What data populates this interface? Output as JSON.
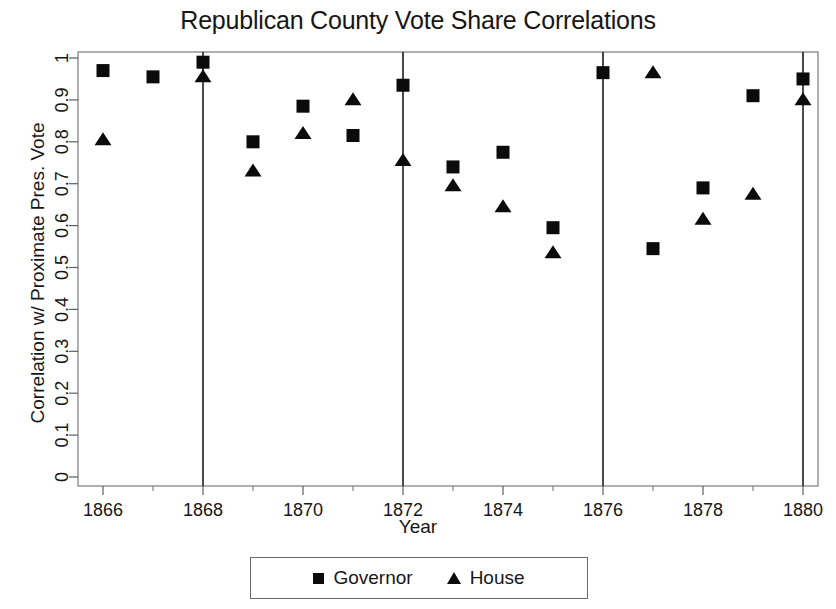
{
  "chart_data": {
    "type": "scatter",
    "title": "Republican County Vote Share Correlations",
    "xlabel": "Year",
    "ylabel": "Correlation w/ Proximate Pres. Vote",
    "xlim": [
      1865.5,
      1880.3
    ],
    "ylim": [
      0,
      1
    ],
    "grid": false,
    "legend_position": "bottom",
    "x_ticks": [
      1866,
      1868,
      1870,
      1872,
      1874,
      1876,
      1878,
      1880
    ],
    "x_tick_labels": [
      "1866",
      "1868",
      "1870",
      "1872",
      "1874",
      "1876",
      "1878",
      "1880"
    ],
    "x_minor_ticks": [
      1867,
      1869,
      1871,
      1873,
      1875,
      1877,
      1879
    ],
    "y_ticks": [
      0,
      0.1,
      0.2,
      0.3,
      0.4,
      0.5,
      0.6,
      0.7,
      0.8,
      0.9,
      1
    ],
    "y_tick_labels": [
      "0",
      "0.1",
      "0.2",
      "0.3",
      "0.4",
      "0.5",
      "0.6",
      "0.7",
      "0.8",
      "0.9",
      "1"
    ],
    "vertical_reference_lines": [
      1868,
      1872,
      1876,
      1880
    ],
    "series": [
      {
        "name": "Governor",
        "marker": "square",
        "color": "#0b0b0b",
        "points": [
          {
            "x": 1866,
            "y": 0.97
          },
          {
            "x": 1867,
            "y": 0.955
          },
          {
            "x": 1868,
            "y": 0.99
          },
          {
            "x": 1869,
            "y": 0.8
          },
          {
            "x": 1870,
            "y": 0.885
          },
          {
            "x": 1871,
            "y": 0.815
          },
          {
            "x": 1872,
            "y": 0.935
          },
          {
            "x": 1873,
            "y": 0.74
          },
          {
            "x": 1874,
            "y": 0.775
          },
          {
            "x": 1875,
            "y": 0.595
          },
          {
            "x": 1876,
            "y": 0.965
          },
          {
            "x": 1877,
            "y": 0.545
          },
          {
            "x": 1878,
            "y": 0.69
          },
          {
            "x": 1879,
            "y": 0.91
          },
          {
            "x": 1880,
            "y": 0.95
          }
        ]
      },
      {
        "name": "House",
        "marker": "triangle",
        "color": "#0b0b0b",
        "points": [
          {
            "x": 1866,
            "y": 0.805
          },
          {
            "x": 1868,
            "y": 0.955
          },
          {
            "x": 1869,
            "y": 0.73
          },
          {
            "x": 1870,
            "y": 0.82
          },
          {
            "x": 1871,
            "y": 0.9
          },
          {
            "x": 1872,
            "y": 0.755
          },
          {
            "x": 1873,
            "y": 0.695
          },
          {
            "x": 1874,
            "y": 0.645
          },
          {
            "x": 1875,
            "y": 0.535
          },
          {
            "x": 1877,
            "y": 0.965
          },
          {
            "x": 1878,
            "y": 0.615
          },
          {
            "x": 1879,
            "y": 0.675
          },
          {
            "x": 1880,
            "y": 0.9
          }
        ]
      }
    ]
  },
  "legend": {
    "items": [
      {
        "label": "Governor",
        "marker": "square"
      },
      {
        "label": "House",
        "marker": "triangle"
      }
    ]
  }
}
